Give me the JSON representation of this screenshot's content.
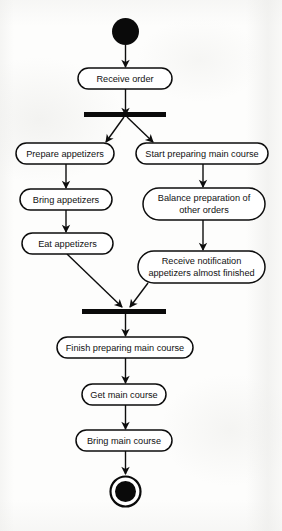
{
  "diagram": {
    "kind": "uml-activity-diagram",
    "background_color": "#fdfdfc",
    "stroke_color": "#0d0d0d",
    "node_fill_color": "#ffffff",
    "nodes": [
      {
        "id": "initial",
        "type": "initial-node",
        "label": ""
      },
      {
        "id": "receive-order",
        "type": "action",
        "label": "Receive order"
      },
      {
        "id": "fork",
        "type": "fork-bar",
        "label": ""
      },
      {
        "id": "prepare-appetizers",
        "type": "action",
        "label": "Prepare appetizers"
      },
      {
        "id": "start-main-course",
        "type": "action",
        "label": "Start preparing main course"
      },
      {
        "id": "bring-appetizers",
        "type": "action",
        "label": "Bring appetizers"
      },
      {
        "id": "balance-preparation",
        "type": "action",
        "label_line1": "Balance preparation of",
        "label_line2": "other orders"
      },
      {
        "id": "eat-appetizers",
        "type": "action",
        "label": "Eat appetizers"
      },
      {
        "id": "receive-notification",
        "type": "action",
        "label_line1": "Receive notification",
        "label_line2": "appetizers almost finished"
      },
      {
        "id": "join",
        "type": "join-bar",
        "label": ""
      },
      {
        "id": "finish-main-course",
        "type": "action",
        "label": "Finish preparing main course"
      },
      {
        "id": "get-main-course",
        "type": "action",
        "label": "Get main course"
      },
      {
        "id": "bring-main-course",
        "type": "action",
        "label": "Bring main course"
      },
      {
        "id": "final",
        "type": "final-node",
        "label": ""
      }
    ],
    "edges": [
      {
        "from": "initial",
        "to": "receive-order"
      },
      {
        "from": "receive-order",
        "to": "fork"
      },
      {
        "from": "fork",
        "to": "prepare-appetizers"
      },
      {
        "from": "fork",
        "to": "start-main-course"
      },
      {
        "from": "prepare-appetizers",
        "to": "bring-appetizers"
      },
      {
        "from": "bring-appetizers",
        "to": "eat-appetizers"
      },
      {
        "from": "start-main-course",
        "to": "balance-preparation"
      },
      {
        "from": "balance-preparation",
        "to": "receive-notification"
      },
      {
        "from": "eat-appetizers",
        "to": "join"
      },
      {
        "from": "receive-notification",
        "to": "join"
      },
      {
        "from": "join",
        "to": "finish-main-course"
      },
      {
        "from": "finish-main-course",
        "to": "get-main-course"
      },
      {
        "from": "get-main-course",
        "to": "bring-main-course"
      },
      {
        "from": "bring-main-course",
        "to": "final"
      }
    ]
  }
}
